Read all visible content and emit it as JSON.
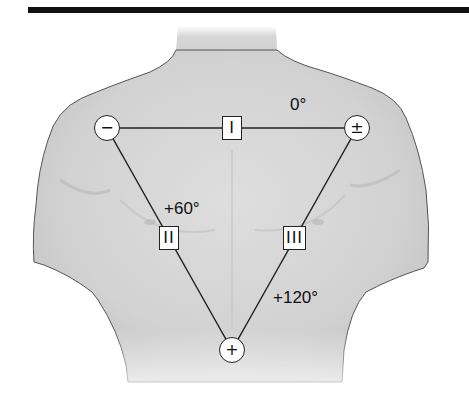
{
  "figure": {
    "electrodes": [
      {
        "id": "right-arm",
        "symbol": "−",
        "x": 107,
        "y": 128
      },
      {
        "id": "left-arm",
        "symbol": "±",
        "x": 357,
        "y": 128
      },
      {
        "id": "left-leg",
        "symbol": "+",
        "x": 232,
        "y": 350
      }
    ],
    "leads": [
      {
        "id": "lead-I",
        "label": "I",
        "angle": "0°",
        "x": 232,
        "y": 128
      },
      {
        "id": "lead-II",
        "label": "II",
        "angle": "+60°",
        "x": 169,
        "y": 238
      },
      {
        "id": "lead-III",
        "label": "III",
        "angle": "+120°",
        "x": 295,
        "y": 238
      }
    ],
    "colors": {
      "skin": "#d9d9d9",
      "line": "#222222",
      "bar": "#111111"
    }
  }
}
